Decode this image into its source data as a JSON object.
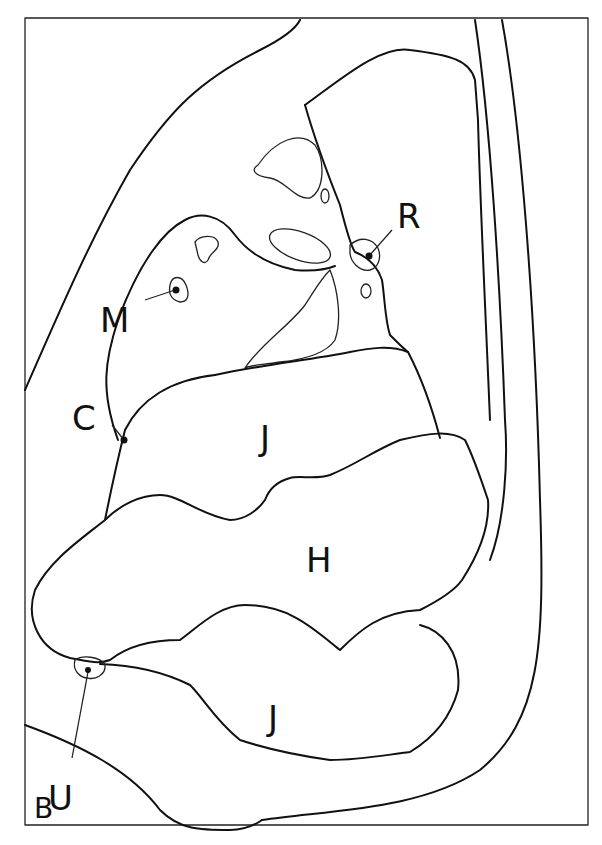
{
  "figure": {
    "panel_label": "B",
    "labels": [
      {
        "id": "R",
        "text": "R"
      },
      {
        "id": "M",
        "text": "M"
      },
      {
        "id": "C",
        "text": "C"
      },
      {
        "id": "J_upper",
        "text": "J"
      },
      {
        "id": "H",
        "text": "H"
      },
      {
        "id": "J_lower",
        "text": "J"
      },
      {
        "id": "U",
        "text": "U"
      }
    ],
    "colors": {
      "line": "#111111",
      "background": "#ffffff"
    }
  }
}
